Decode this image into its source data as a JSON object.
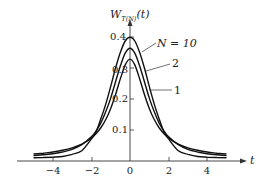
{
  "chart_data": {
    "type": "line",
    "title": "",
    "xlabel": "t",
    "ylabel": "W_T(N)(t)",
    "ylabel_main": "W",
    "ylabel_sub": "T(N)",
    "ylabel_arg": "(t)",
    "xlim": [
      -5,
      5
    ],
    "ylim": [
      0,
      0.42
    ],
    "grid": false,
    "legend_position": "inline labels, upper right of peak",
    "x_ticks": [
      -4,
      -2,
      0,
      2,
      4
    ],
    "x_tick_labels": [
      "−4",
      "−2",
      "0",
      "2",
      "4"
    ],
    "y_ticks": [
      0.1,
      0.2,
      0.3,
      0.4
    ],
    "y_tick_labels": [
      "0.1",
      "0.2",
      "0.3",
      "0.4"
    ],
    "x": [
      -5,
      -4.5,
      -4,
      -3.5,
      -3,
      -2.5,
      -2,
      -1.75,
      -1.5,
      -1.25,
      -1,
      -0.75,
      -0.5,
      -0.25,
      0,
      0.25,
      0.5,
      0.75,
      1,
      1.25,
      1.5,
      1.75,
      2,
      2.5,
      3,
      3.5,
      4,
      4.5,
      5
    ],
    "series": [
      {
        "name": "N=10",
        "label": "N = 10",
        "values": [
          0.0004,
          0.0011,
          0.002,
          0.0041,
          0.0114,
          0.0229,
          0.0611,
          0.0852,
          0.1274,
          0.1747,
          0.2304,
          0.2887,
          0.3397,
          0.3768,
          0.3891,
          0.3768,
          0.3397,
          0.2887,
          0.2304,
          0.1747,
          0.1274,
          0.0852,
          0.0611,
          0.0229,
          0.0114,
          0.0041,
          0.002,
          0.0011,
          0.0004
        ]
      },
      {
        "name": "N=2",
        "label": "2",
        "values": [
          0.0071,
          0.0098,
          0.0131,
          0.0188,
          0.0274,
          0.0422,
          0.068,
          0.087,
          0.1136,
          0.1499,
          0.1925,
          0.2445,
          0.2962,
          0.3373,
          0.3536,
          0.3373,
          0.2962,
          0.2445,
          0.1925,
          0.1499,
          0.1136,
          0.087,
          0.068,
          0.0422,
          0.0274,
          0.0188,
          0.0131,
          0.0098,
          0.0071
        ]
      },
      {
        "name": "N=1",
        "label": "1",
        "values": [
          0.0122,
          0.0149,
          0.0187,
          0.0244,
          0.0318,
          0.0439,
          0.0637,
          0.078,
          0.0979,
          0.1242,
          0.1592,
          0.2037,
          0.2546,
          0.2996,
          0.3183,
          0.2996,
          0.2546,
          0.2037,
          0.1592,
          0.1242,
          0.0979,
          0.078,
          0.0637,
          0.0439,
          0.0318,
          0.0244,
          0.0187,
          0.0149,
          0.0122
        ]
      }
    ]
  },
  "labels": {
    "n10": "N = 10",
    "n2": "2",
    "n1": "1",
    "x_axis": "t",
    "tick_x_m4": "−4",
    "tick_x_m2": "−2",
    "tick_x_0": "0",
    "tick_x_2": "2",
    "tick_x_4": "4",
    "tick_y_01": "0.1",
    "tick_y_02": "0.2",
    "tick_y_03": "0.3",
    "tick_y_04": "0.4",
    "y_main": "W",
    "y_sub": "T(N)",
    "y_arg": "(t)"
  }
}
